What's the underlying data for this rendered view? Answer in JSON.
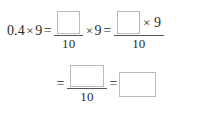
{
  "exercise": {
    "type": "fill-in-the-blank",
    "subject": "decimal multiplication",
    "multiplicand": "0.4",
    "multiplier": "9",
    "denominator": "10",
    "times_symbol": "×",
    "equals_symbol": "=",
    "blank_placeholder": "",
    "line1": {
      "left_expression": {
        "factor_a": "0.4",
        "operator": "×",
        "factor_b": "9"
      },
      "equals_1": "=",
      "fraction_1": {
        "numerator_blank": "",
        "denominator": "10"
      },
      "operator_2": "×",
      "factor_c": "9",
      "equals_2": "=",
      "fraction_2": {
        "numerator_blank": "",
        "numerator_operator": "×",
        "numerator_factor": "9",
        "denominator": "10"
      }
    },
    "line2": {
      "equals_3": "=",
      "fraction_3": {
        "numerator_blank": "",
        "denominator": "10"
      },
      "equals_4": "=",
      "answer_blank": ""
    }
  },
  "style": {
    "text_color": "#2b2b2b",
    "rule_color": "#555555",
    "blank_border_color": "#b9b9bd",
    "background_color": "#ffffff"
  }
}
